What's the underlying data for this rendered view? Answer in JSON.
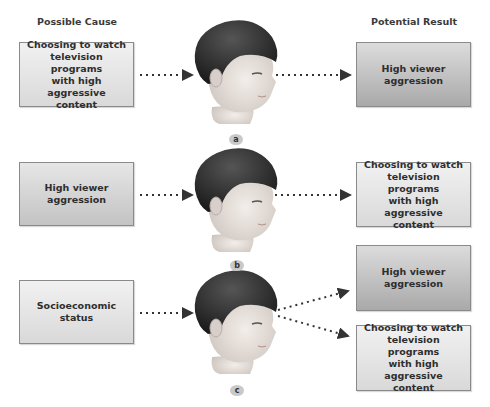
{
  "headers": {
    "left": "Possible Cause",
    "right": "Potential Result"
  },
  "panels": [
    {
      "label": "a",
      "cause": "Choosing to watch\ntelevision programs\nwith high\naggressive content",
      "results": [
        "High viewer\naggression"
      ]
    },
    {
      "label": "b",
      "cause": "High viewer\naggression",
      "results": [
        "Choosing to watch\ntelevision programs\nwith high\naggressive content"
      ]
    },
    {
      "label": "c",
      "cause": "Socioeconomic\nstatus",
      "results": [
        "High viewer\naggression",
        "Choosing to watch\ntelevision programs\nwith high\naggressive content"
      ]
    }
  ],
  "colors": {
    "hair": "#2b2b2b",
    "skin": "#e9e2dd",
    "arrow": "#333333",
    "box_border": "#8a8a8a"
  }
}
